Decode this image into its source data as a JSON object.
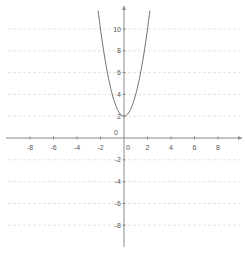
{
  "chart_data": {
    "type": "line",
    "title": "",
    "xlabel": "",
    "ylabel": "",
    "function": "y = 2x^2 + 2",
    "series": [
      {
        "name": "parabola",
        "color": "#707070",
        "x": [
          -2.2,
          -2,
          -1.5,
          -1,
          -0.5,
          0,
          0.5,
          1,
          1.5,
          2,
          2.2
        ],
        "y": [
          11.68,
          10,
          6.5,
          4,
          2.5,
          2,
          2.5,
          4,
          6.5,
          10,
          11.68
        ]
      }
    ],
    "xlim": [
      -10.3,
      10.3
    ],
    "ylim": [
      -10,
      12.5
    ],
    "x_ticks": [
      -8,
      -6,
      -4,
      -2,
      0,
      2,
      4,
      6,
      8
    ],
    "x_tick_labels": [
      "-8",
      "-6",
      "-4",
      "-2",
      "0",
      "2",
      "4",
      "6",
      "8"
    ],
    "y_ticks": [
      10,
      8,
      6,
      4,
      2,
      0,
      -2,
      -4,
      -6,
      -8
    ],
    "y_tick_labels": [
      "10",
      "8",
      "6",
      "4",
      "2",
      "0",
      "-2",
      "-4",
      "-6",
      "-8"
    ],
    "grid": true,
    "grid_style": "horizontal dashed",
    "legend": "none",
    "colors": {
      "axis": "#8a8a8a",
      "grid": "#e4e4e4",
      "curve": "#707070",
      "labels": "#555555"
    }
  }
}
